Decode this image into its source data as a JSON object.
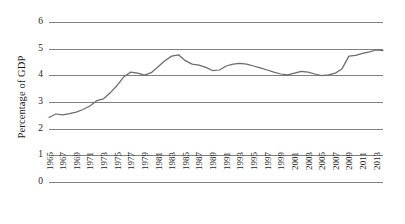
{
  "chart_data": {
    "type": "line",
    "title": "",
    "xlabel": "",
    "ylabel": "Percentage of GDP",
    "ylim": [
      0,
      6
    ],
    "yticks": [
      0,
      1,
      2,
      3,
      4,
      5,
      6
    ],
    "ytick_labels": [
      "0",
      "1",
      "2",
      "3",
      "4",
      "5",
      "6"
    ],
    "grid": true,
    "grid_axis": "y",
    "legend": null,
    "legend_position": "none",
    "series_color": "#6b6b6b",
    "grid_color": "#808080",
    "xlim": [
      1965,
      2014
    ],
    "xtick_labels": [
      "1965",
      "1967",
      "1969",
      "1971",
      "1973",
      "1975",
      "1977",
      "1979",
      "1981",
      "1983",
      "1985",
      "1987",
      "1989",
      "1991",
      "1993",
      "1995",
      "1997",
      "1999",
      "2001",
      "2003",
      "2005",
      "2007",
      "2009",
      "2011",
      "2013"
    ],
    "x": [
      1965,
      1966,
      1967,
      1968,
      1969,
      1970,
      1971,
      1972,
      1973,
      1974,
      1975,
      1976,
      1977,
      1978,
      1979,
      1980,
      1981,
      1982,
      1983,
      1984,
      1985,
      1986,
      1987,
      1988,
      1989,
      1990,
      1991,
      1992,
      1993,
      1994,
      1995,
      1996,
      1997,
      1998,
      1999,
      2000,
      2001,
      2002,
      2003,
      2004,
      2005,
      2006,
      2007,
      2008,
      2009,
      2010,
      2011,
      2012,
      2013,
      2014
    ],
    "values": [
      2.42,
      2.55,
      2.52,
      2.56,
      2.62,
      2.72,
      2.85,
      3.05,
      3.12,
      3.35,
      3.62,
      3.95,
      4.12,
      4.08,
      4.01,
      4.1,
      4.32,
      4.55,
      4.72,
      4.77,
      4.55,
      4.42,
      4.38,
      4.3,
      4.18,
      4.2,
      4.35,
      4.42,
      4.45,
      4.42,
      4.35,
      4.28,
      4.2,
      4.12,
      4.05,
      4.02,
      4.08,
      4.15,
      4.12,
      4.05,
      3.99,
      4.02,
      4.08,
      4.25,
      4.72,
      4.75,
      4.82,
      4.88,
      4.95,
      4.93
    ]
  },
  "axis": {
    "y_title": "Percentage of GDP"
  }
}
